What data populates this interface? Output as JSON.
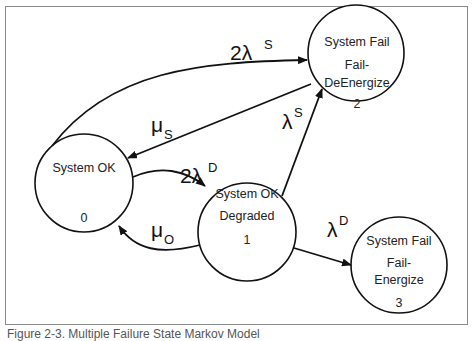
{
  "states": [
    {
      "id": "0",
      "lines": [
        "System OK",
        "",
        "0"
      ]
    },
    {
      "id": "1",
      "lines": [
        "System OK",
        "Degraded",
        "1"
      ]
    },
    {
      "id": "2",
      "lines": [
        "System Fail",
        "Fail-",
        "DeEnergize",
        "2"
      ]
    },
    {
      "id": "3",
      "lines": [
        "System Fail",
        "Fail-",
        "Energize",
        "3"
      ]
    }
  ],
  "transitions": [
    {
      "from": "0",
      "to": "2",
      "rate": "2λ",
      "sup": "S"
    },
    {
      "from": "2",
      "to": "0",
      "rate": "μ",
      "sup": "S"
    },
    {
      "from": "0",
      "to": "1",
      "rate": "2λ",
      "sup": "D"
    },
    {
      "from": "1",
      "to": "0",
      "rate": "μ",
      "sup": "O"
    },
    {
      "from": "1",
      "to": "2",
      "rate": "λ",
      "sup": "S"
    },
    {
      "from": "1",
      "to": "3",
      "rate": "λ",
      "sup": "D"
    }
  ],
  "caption": "Figure 2-3. Multiple Failure State Markov Model"
}
